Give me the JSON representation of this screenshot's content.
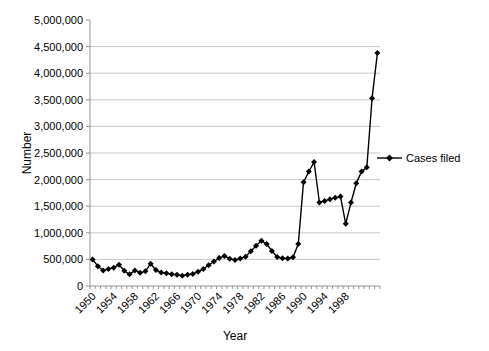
{
  "chart_data": {
    "type": "line",
    "title": "",
    "xlabel": "Year",
    "ylabel": "Number",
    "x": [
      1950,
      1951,
      1952,
      1953,
      1954,
      1955,
      1956,
      1957,
      1958,
      1959,
      1960,
      1961,
      1962,
      1963,
      1964,
      1965,
      1966,
      1967,
      1968,
      1969,
      1970,
      1971,
      1972,
      1973,
      1974,
      1975,
      1976,
      1977,
      1978,
      1979,
      1980,
      1981,
      1982,
      1983,
      1984,
      1985,
      1986,
      1987,
      1988,
      1989,
      1990,
      1991,
      1992,
      1993,
      1994,
      1995,
      1996,
      1997,
      1998,
      1999,
      2000,
      2001,
      2002,
      2003,
      2004
    ],
    "series": [
      {
        "name": "Cases filed",
        "marker": "diamond",
        "color": "#000000",
        "values": [
          500000,
          370000,
          290000,
          320000,
          345000,
          400000,
          285000,
          220000,
          290000,
          250000,
          275000,
          420000,
          300000,
          255000,
          240000,
          220000,
          210000,
          195000,
          210000,
          225000,
          270000,
          320000,
          390000,
          460000,
          525000,
          565000,
          510000,
          490000,
          515000,
          550000,
          655000,
          755000,
          850000,
          790000,
          660000,
          545000,
          520000,
          515000,
          540000,
          790000,
          1950000,
          2150000,
          2330000,
          1570000,
          1600000,
          1630000,
          1660000,
          1680000,
          1170000,
          1570000,
          1930000,
          2150000,
          2230000,
          3530000,
          4380000
        ]
      }
    ],
    "ylim": [
      0,
      5000000
    ],
    "ytick_step": 500000,
    "ytick_labels": [
      "0",
      "500,000",
      "1,000,000",
      "1,500,000",
      "2,000,000",
      "2,500,000",
      "3,000,000",
      "3,500,000",
      "4,000,000",
      "4,500,000",
      "5,000,000"
    ],
    "xtick_labels": [
      "1950",
      "1954",
      "1958",
      "1962",
      "1966",
      "1970",
      "1974",
      "1978",
      "1982",
      "1986",
      "1990",
      "1994",
      "1998"
    ],
    "xtick_label_interval": 4,
    "grid": true,
    "legend_position": "right",
    "colors": {
      "series": "#000000",
      "gridline": "#c9c9c9",
      "axis": "#969696",
      "text": "#000000",
      "background": "#ffffff"
    }
  }
}
